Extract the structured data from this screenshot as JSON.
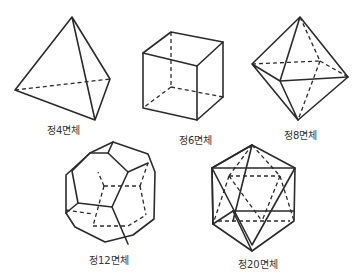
{
  "solids": [
    {
      "id": "tetrahedron",
      "label": "정4면체",
      "faces": 4
    },
    {
      "id": "hexahedron",
      "label": "정6면체",
      "faces": 6
    },
    {
      "id": "octahedron",
      "label": "정8면체",
      "faces": 8
    },
    {
      "id": "dodecahedron",
      "label": "정12면체",
      "faces": 12
    },
    {
      "id": "icosahedron",
      "label": "정20면체",
      "faces": 20
    }
  ],
  "colors": {
    "line": "#2b2b2b",
    "background": "#ffffff"
  }
}
